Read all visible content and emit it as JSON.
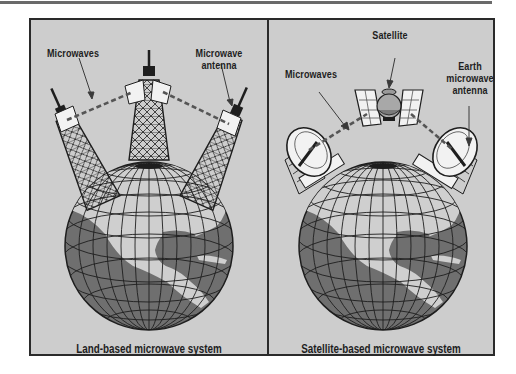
{
  "figure": {
    "panels": [
      {
        "id": "land",
        "caption": "Land-based microwave system",
        "labels": {
          "microwaves": "Microwaves",
          "antenna_line1": "Microwave",
          "antenna_line2": "antenna"
        }
      },
      {
        "id": "satellite",
        "caption": "Satellite-based microwave system",
        "labels": {
          "satellite": "Satellite",
          "microwaves": "Microwaves",
          "antenna_line1": "Earth",
          "antenna_line2": "microwave",
          "antenna_line3": "antenna"
        }
      }
    ]
  },
  "colors": {
    "background": "#cdcdcd",
    "ocean": "#6f6f6f",
    "land": "#cfcfcf",
    "lake": "#7a7a7a",
    "line": "#1e1e1e",
    "dish": "#f2f2f2",
    "signal": "#555555"
  },
  "icons": [
    "globe-icon",
    "tower-icon",
    "antenna-dish-icon",
    "satellite-icon",
    "microwave-signal-icon",
    "pointer-arrow-icon"
  ]
}
